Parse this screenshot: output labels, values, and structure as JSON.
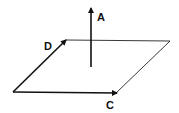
{
  "diagram": {
    "type": "vector-plane",
    "labels": {
      "a": "A",
      "c": "C",
      "d": "D"
    },
    "colors": {
      "stroke": "#111111",
      "background": "#ffffff"
    }
  }
}
